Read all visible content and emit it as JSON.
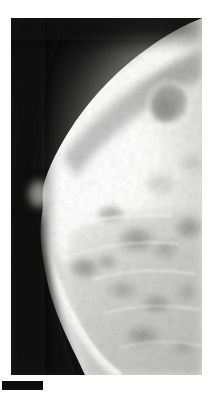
{
  "figure": {
    "kind": "medical-radiograph",
    "modality": "mammogram",
    "view_label": "",
    "caption_text": ""
  },
  "canvas": {
    "width": 209,
    "height": 394,
    "page_background": "#ffffff"
  },
  "panel": {
    "x": 11,
    "y": 18,
    "width": 191,
    "height": 357,
    "background_color": "#111111",
    "border_color": "#ffffff"
  },
  "label_bar": {
    "x": 2,
    "y": 381,
    "width": 41,
    "height": 9,
    "color": "#0d0d0d",
    "text": ""
  },
  "palette": {
    "background_dark": "#0f0f0f",
    "background_dark_2": "#1b1b1b",
    "skin_halo": "#6a6a6a",
    "tissue_bright": "#f8f8f6",
    "tissue_white": "#ffffff",
    "tissue_mid": "#d2d2cf",
    "tissue_gray": "#b4b4b1",
    "mass_gray": "#9a9a9a",
    "mass_dark": "#878787",
    "fat_dark": "#7c7c7a"
  },
  "anatomy": {
    "orientation": "breast tissue at right, skin border convex toward left",
    "regions": [
      {
        "name": "background-field",
        "description": "dark exposed film surrounding the breast, upper-left and lower-left"
      },
      {
        "name": "skin-line",
        "description": "thin brighter skin boundary arcing from top-right down and around to lower-right"
      },
      {
        "name": "subcutaneous-fat-band",
        "description": "darker band just inside the skin line"
      },
      {
        "name": "fibroglandular-tissue",
        "description": "large bright dense tissue region filling center and upper right"
      },
      {
        "name": "dominant-mass",
        "description": "rounded lower-density mass in upper right quadrant, approx 34x36 px",
        "cx": 168,
        "cy": 103,
        "rx": 19,
        "ry": 20
      },
      {
        "name": "lower-glandular-nodules",
        "description": "cluster of mid-gray lobulated densities across the lower half"
      },
      {
        "name": "nipple-profile",
        "description": "slight skin protrusion at left margin near vertical mid-height"
      },
      {
        "name": "pectoral-shadow",
        "description": "brightened tissue running along the right edge of the film"
      }
    ]
  }
}
